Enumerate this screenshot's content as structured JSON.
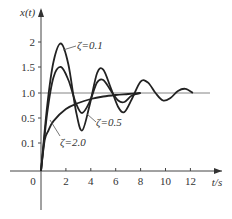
{
  "chart_data": {
    "type": "line",
    "title": "",
    "xlabel": "t/s",
    "ylabel": "x(t)",
    "xlim": [
      0,
      13.5
    ],
    "ylim": [
      0,
      2.3
    ],
    "x_ticks": [
      "0",
      "2",
      "4",
      "6",
      "8",
      "10",
      "12"
    ],
    "y_ticks": [
      "0.1",
      "0.5",
      "1.0",
      "1.5",
      "2"
    ],
    "reference_line": {
      "y": 1.0
    },
    "legend_position": "inline annotations",
    "series": [
      {
        "name": "ζ=0.1",
        "annotation": "ζ=0.1",
        "peak": 1.97,
        "peak_t": 1.6,
        "x": [
          0,
          0.5,
          1.0,
          1.6,
          2.2,
          2.8,
          3.3,
          3.9,
          4.5,
          5.0,
          5.6,
          6.2,
          6.7,
          7.3,
          8.0,
          8.6,
          9.2,
          9.8,
          10.4,
          11.0,
          11.6,
          12.2
        ],
        "values": [
          0,
          0.75,
          1.6,
          1.97,
          1.55,
          0.65,
          0.3,
          0.75,
          1.38,
          1.45,
          1.1,
          0.72,
          0.62,
          0.88,
          1.22,
          1.2,
          1.0,
          0.85,
          0.9,
          1.04,
          1.08,
          1.0
        ]
      },
      {
        "name": "ζ=0.5",
        "annotation": "ζ=0.5",
        "peak": 1.5,
        "peak_t": 1.6,
        "x": [
          0,
          0.5,
          1.0,
          1.6,
          2.2,
          2.8,
          3.3,
          3.9,
          4.5,
          5.0,
          5.6,
          6.2,
          6.7,
          7.3,
          8.0
        ],
        "values": [
          0,
          0.6,
          1.3,
          1.5,
          1.25,
          0.8,
          0.6,
          0.82,
          1.2,
          1.25,
          1.05,
          0.85,
          0.82,
          0.95,
          1.0
        ]
      },
      {
        "name": "ζ=2.0",
        "annotation": "ζ=2.0",
        "x": [
          0,
          0.3,
          0.6,
          1,
          2,
          3,
          4,
          5,
          6,
          7,
          8
        ],
        "values": [
          0,
          0.15,
          0.3,
          0.45,
          0.68,
          0.8,
          0.88,
          0.93,
          0.96,
          0.98,
          1.0
        ]
      }
    ]
  }
}
